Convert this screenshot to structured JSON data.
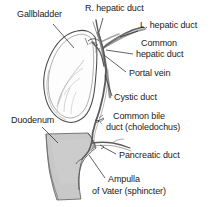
{
  "figure": {
    "background_color": "#ffffff",
    "ink_color": "#3c3c3c",
    "duodenum_fill": "#c8c8c8",
    "vessel_fill": "#9a9a9a"
  },
  "labels": {
    "gallbladder": "Gallbladder",
    "r_hepatic_duct": "R. hepatic duct",
    "l_hepatic_duct": "L. hepatic duct",
    "common_hepatic_duct_line1": "Common",
    "common_hepatic_duct_line2": "hepatic duct",
    "portal_vein": "Portal vein",
    "cystic_duct": "Cystic duct",
    "common_bile_duct_line1": "Common bile",
    "common_bile_duct_line2": "duct (choledochus)",
    "pancreatic_duct": "Pancreatic duct",
    "duodenum": "Duodenum",
    "ampulla_line1": "Ampulla",
    "ampulla_line2": "of Vater (sphincter)"
  },
  "structures": [
    {
      "name": "gallbladder",
      "kind": "organ"
    },
    {
      "name": "right-hepatic-duct",
      "kind": "duct"
    },
    {
      "name": "left-hepatic-duct",
      "kind": "duct"
    },
    {
      "name": "common-hepatic-duct",
      "kind": "duct"
    },
    {
      "name": "portal-vein",
      "kind": "vessel"
    },
    {
      "name": "cystic-duct",
      "kind": "duct"
    },
    {
      "name": "common-bile-duct",
      "kind": "duct"
    },
    {
      "name": "pancreatic-duct",
      "kind": "duct"
    },
    {
      "name": "duodenum",
      "kind": "organ"
    },
    {
      "name": "ampulla-of-vater",
      "kind": "sphincter"
    }
  ]
}
